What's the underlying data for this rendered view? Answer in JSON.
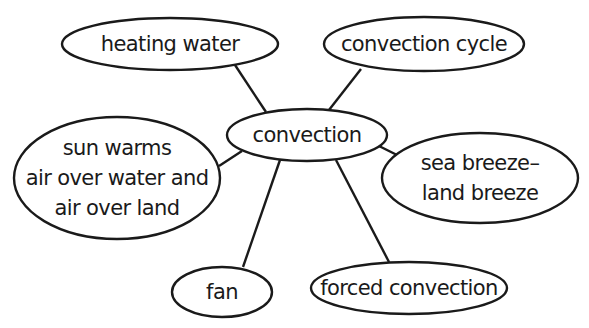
{
  "diagram": {
    "type": "concept-map",
    "colors": {
      "stroke": "#1a1a1a",
      "fill": "#ffffff",
      "text": "#1a1a1a"
    },
    "center": {
      "id": "convection",
      "lines": [
        "convection"
      ],
      "cx": 307,
      "cy": 135,
      "rx": 80,
      "ry": 26
    },
    "nodes": [
      {
        "id": "heating-water",
        "lines": [
          "heating water"
        ],
        "cx": 170,
        "cy": 44,
        "rx": 108,
        "ry": 26,
        "edge": {
          "x1": 235,
          "y1": 65,
          "x2": 266,
          "y2": 112
        }
      },
      {
        "id": "convection-cycle",
        "lines": [
          "convection cycle"
        ],
        "cx": 424,
        "cy": 44,
        "rx": 100,
        "ry": 27,
        "edge": {
          "x1": 361,
          "y1": 69,
          "x2": 329,
          "y2": 110
        }
      },
      {
        "id": "sun-warms",
        "lines": [
          "sun warms",
          "air over water and",
          "air over land"
        ],
        "cx": 117,
        "cy": 178,
        "rx": 103,
        "ry": 61,
        "edge": {
          "x1": 219,
          "y1": 166,
          "x2": 242,
          "y2": 151
        }
      },
      {
        "id": "sea-breeze",
        "lines": [
          "sea breeze–",
          "land breeze"
        ],
        "cx": 480,
        "cy": 178,
        "rx": 98,
        "ry": 45,
        "edge": {
          "x1": 401,
          "y1": 157,
          "x2": 377,
          "y2": 145
        }
      },
      {
        "id": "fan",
        "lines": [
          "fan"
        ],
        "cx": 222,
        "cy": 292,
        "rx": 50,
        "ry": 25,
        "edge": {
          "x1": 243,
          "y1": 267,
          "x2": 280,
          "y2": 160
        }
      },
      {
        "id": "forced-convection",
        "lines": [
          "forced convection"
        ],
        "cx": 409,
        "cy": 288,
        "rx": 98,
        "ry": 26,
        "edge": {
          "x1": 389,
          "y1": 262,
          "x2": 336,
          "y2": 160
        }
      }
    ]
  }
}
